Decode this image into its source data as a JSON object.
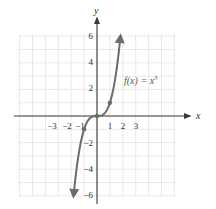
{
  "chart_data": {
    "type": "line",
    "title": "",
    "xlabel": "x",
    "ylabel": "y",
    "xlim": [
      -6,
      6
    ],
    "ylim": [
      -6,
      6
    ],
    "grid": true,
    "x_tick_labels": [
      "-3",
      "-2",
      "-1",
      "1",
      "2",
      "3"
    ],
    "x_ticks": [
      -3,
      -2,
      -1,
      1,
      2,
      3
    ],
    "y_tick_labels": [
      "6",
      "4",
      "2",
      "-2",
      "-4",
      "-6"
    ],
    "y_ticks": [
      6,
      4,
      2,
      -2,
      -4,
      -6
    ],
    "series": [
      {
        "name": "f(x) = x^3",
        "function": "x^3",
        "x_range": [
          -1.817,
          1.817
        ],
        "arrows_at_ends": true,
        "x": [
          -1.8,
          -1.5,
          -1,
          -0.5,
          0,
          0.5,
          1,
          1.5,
          1.8
        ],
        "values": [
          -5.83,
          -3.375,
          -1,
          -0.125,
          0,
          0.125,
          1,
          3.375,
          5.83
        ]
      }
    ],
    "marked_points": [
      {
        "x": -1,
        "y": -1
      },
      {
        "x": 0,
        "y": 0
      },
      {
        "x": 1,
        "y": 1
      }
    ],
    "annotations": [
      {
        "text": "f(x) = x³",
        "x": 2.1,
        "y": 2.6
      }
    ],
    "colors": {
      "curve": "#6b6b6b",
      "axes": "#3a3a3a",
      "grid": "#c8c8c8"
    }
  },
  "labels": {
    "x_axis": "x",
    "y_axis": "y",
    "function_label_prefix": "f(x) = x",
    "function_label_exponent": "3",
    "x_ticks": [
      "−3",
      "−2",
      "−1",
      "1",
      "2",
      "3"
    ],
    "y_ticks": [
      "6",
      "4",
      "2",
      "−2",
      "−4",
      "−6"
    ]
  }
}
